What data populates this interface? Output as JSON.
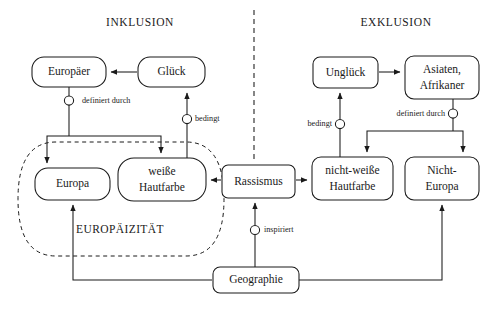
{
  "diagram": {
    "sections": [
      {
        "id": "inklusion",
        "label": "INKLUSION",
        "x": 140,
        "y": 22
      },
      {
        "id": "exklusion",
        "label": "EXKLUSION",
        "x": 396,
        "y": 22
      }
    ],
    "zone": {
      "label": "EUROPÄIZITÄT",
      "x": 120,
      "y": 230
    },
    "nodes": [
      {
        "id": "europaeer",
        "label": "Europäer",
        "lines": [
          "Europäer"
        ],
        "x": 32,
        "y": 57,
        "w": 74,
        "h": 30
      },
      {
        "id": "glueck",
        "label": "Glück",
        "lines": [
          "Glück"
        ],
        "x": 138,
        "y": 57,
        "w": 67,
        "h": 30
      },
      {
        "id": "europa",
        "label": "Europa",
        "lines": [
          "Europa"
        ],
        "x": 35,
        "y": 168,
        "w": 75,
        "h": 32
      },
      {
        "id": "weisse-haut",
        "label": "weiße Hautfarbe",
        "lines": [
          "weiße",
          "Hautfarbe"
        ],
        "x": 118,
        "y": 158,
        "w": 88,
        "h": 43
      },
      {
        "id": "rassismus",
        "label": "Rassismus",
        "lines": [
          "Rassismus"
        ],
        "x": 222,
        "y": 165,
        "w": 73,
        "h": 33
      },
      {
        "id": "unglueck",
        "label": "Unglück",
        "lines": [
          "Unglück"
        ],
        "x": 313,
        "y": 57,
        "w": 65,
        "h": 31
      },
      {
        "id": "asiaten",
        "label": "Asiaten, Afrikaner",
        "lines": [
          "Asiaten,",
          "Afrikaner"
        ],
        "x": 405,
        "y": 56,
        "w": 74,
        "h": 43
      },
      {
        "id": "nicht-weisse",
        "label": "nicht-weiße Hautfarbe",
        "lines": [
          "nicht-weiße",
          "Hautfarbe"
        ],
        "x": 312,
        "y": 157,
        "w": 81,
        "h": 43
      },
      {
        "id": "nicht-europa",
        "label": "Nicht-Europa",
        "lines": [
          "Nicht-",
          "Europa"
        ],
        "x": 405,
        "y": 157,
        "w": 74,
        "h": 43
      },
      {
        "id": "geographie",
        "label": "Geographie",
        "lines": [
          "Geographie"
        ],
        "x": 213,
        "y": 267,
        "w": 86,
        "h": 26
      }
    ],
    "relations": [
      {
        "id": "rel-definiert-durch-links",
        "label": "definiert durch",
        "cx": 69,
        "cy": 100,
        "side": "right",
        "from": "europaeer",
        "to": [
          "europa",
          "weisse-haut"
        ]
      },
      {
        "id": "rel-bedingt-links",
        "label": "bedingt",
        "cx": 187,
        "cy": 119,
        "side": "right",
        "from": [
          "europa",
          "weisse-haut"
        ],
        "to": "glueck"
      },
      {
        "id": "rel-bedingt-rechts",
        "label": "bedingt",
        "cx": 340,
        "cy": 124,
        "side": "left",
        "from": "nicht-weisse",
        "to": "unglueck"
      },
      {
        "id": "rel-definiert-durch-rechts",
        "label": "definiert durch",
        "cx": 453,
        "cy": 113,
        "side": "left",
        "from": "asiaten",
        "to": [
          "nicht-weisse",
          "nicht-europa"
        ]
      },
      {
        "id": "rel-inspiriert",
        "label": "inspiriert",
        "cx": 255,
        "cy": 230,
        "side": "right",
        "from": "geographie",
        "to": "rassismus"
      }
    ],
    "arrows": [
      {
        "id": "arrow-glueck-to-europaeer",
        "from": "glueck",
        "to": "europaeer",
        "kind": "solid-arrow"
      },
      {
        "id": "arrow-unglueck-to-asiaten",
        "from": "unglueck",
        "to": "asiaten",
        "kind": "solid-arrow"
      },
      {
        "id": "arrow-rassismus-to-weisse",
        "from": "rassismus",
        "to": "weisse-haut",
        "kind": "solid-arrow"
      },
      {
        "id": "arrow-rassismus-to-nichtweisse",
        "from": "rassismus",
        "to": "nicht-weisse",
        "kind": "solid-arrow"
      },
      {
        "id": "arrow-europaeer-to-europa",
        "from": "europaeer",
        "to": "europa",
        "kind": "solid-arrow"
      },
      {
        "id": "arrow-europaeer-to-weisse",
        "from": "europaeer",
        "to": "weisse-haut",
        "kind": "solid-arrow"
      },
      {
        "id": "arrow-weisse-to-glueck",
        "from": "weisse-haut",
        "to": "glueck",
        "kind": "solid-arrow"
      },
      {
        "id": "arrow-asiaten-to-nichtweisse",
        "from": "asiaten",
        "to": "nicht-weisse",
        "kind": "solid-arrow"
      },
      {
        "id": "arrow-asiaten-to-nichteuropa",
        "from": "asiaten",
        "to": "nicht-europa",
        "kind": "solid-arrow"
      },
      {
        "id": "arrow-nichtweisse-to-unglueck",
        "from": "nicht-weisse",
        "to": "unglueck",
        "kind": "solid-arrow"
      },
      {
        "id": "arrow-geographie-to-europa",
        "from": "geographie",
        "to": "europa",
        "kind": "solid-arrow"
      },
      {
        "id": "arrow-geographie-to-rassismus",
        "from": "geographie",
        "to": "rassismus",
        "kind": "solid-arrow"
      },
      {
        "id": "arrow-geographie-to-nichteuropa",
        "from": "geographie",
        "to": "nicht-europa",
        "kind": "solid-arrow"
      }
    ],
    "divider": {
      "id": "center-divider",
      "x": 254,
      "y1": 10,
      "y2": 160,
      "style": "dashed"
    },
    "colors": {
      "ink": "#1a1a1a",
      "paper": "#ffffff"
    }
  }
}
